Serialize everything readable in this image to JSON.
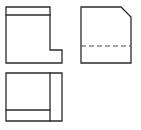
{
  "sheet": {
    "title": "Orthographic three-view engineering drawing",
    "width": 141,
    "height": 130,
    "background_color": "#ffffff",
    "line_color": "#2b2b2b",
    "hidden_line_color": "#4a4a4a",
    "line_width": 1.3,
    "projection_note": "third-angle multiview: front view upper-left, side view upper-right, top/plan view lower-left"
  },
  "views": {
    "front": {
      "name": "front-view",
      "description": "L-shaped profile with horizontal step line near top and notched lower-right corner",
      "bounds": {
        "x": 6,
        "y": 7,
        "width": 56,
        "height": 56
      },
      "outline_points": "6,7 50,7 50,50 62,50 62,63 6,63",
      "internal_lines": [
        {
          "name": "upper-step-line",
          "type": "visible",
          "x1": 6,
          "y1": 15,
          "x2": 50,
          "y2": 15
        }
      ]
    },
    "side": {
      "name": "side-view",
      "description": "Rectangle with chamfered upper-right corner and a dashed hidden edge across the lower third",
      "bounds": {
        "x": 81,
        "y": 7,
        "width": 50,
        "height": 56
      },
      "outline_points": "81,7 121,7 131,17 131,63 81,63",
      "internal_lines": [
        {
          "name": "hidden-edge-line",
          "type": "hidden",
          "x1": 81,
          "y1": 46,
          "x2": 131,
          "y2": 46,
          "dash": "5,3"
        }
      ]
    },
    "top": {
      "name": "top-view",
      "description": "Rectangle divided by a vertical line near the right edge and a horizontal line near the bottom edge",
      "bounds": {
        "x": 6,
        "y": 73,
        "width": 56,
        "height": 48
      },
      "outline_points": "6,73 62,73 62,121 6,121",
      "internal_lines": [
        {
          "name": "vertical-division-line",
          "type": "visible",
          "x1": 50,
          "y1": 73,
          "x2": 50,
          "y2": 121
        },
        {
          "name": "horizontal-division-line",
          "type": "visible",
          "x1": 6,
          "y1": 110,
          "x2": 50,
          "y2": 110
        }
      ]
    }
  }
}
